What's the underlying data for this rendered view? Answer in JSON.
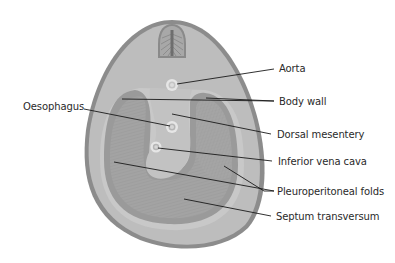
{
  "colors": {
    "outline": "#8c8c8c",
    "body_fill": "#bdbdbd",
    "inner_ring": "#c9c9c9",
    "cavity_dark": "#9e9e9e",
    "septum": "#a9a9a9",
    "mesentery": "#c2c2c2",
    "vessel_ring": "#e8e8e8",
    "leader_line": "#1a1a1a",
    "text": "#2a2a2a"
  },
  "labels": {
    "aorta": "Aorta",
    "body_wall": "Body wall",
    "oesophagus": "Oesophagus",
    "dorsal_mesentery": "Dorsal mesentery",
    "inferior_vena_cava": "Inferior vena cava",
    "pleuroperitoneal_folds": "Pleuroperitoneal folds",
    "septum_transversum": "Septum transversum"
  }
}
